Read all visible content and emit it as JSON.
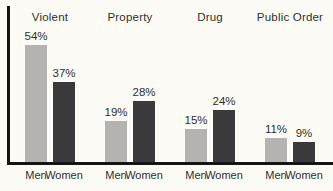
{
  "chart_data": {
    "type": "bar",
    "title": "",
    "categories": [
      "Violent",
      "Property",
      "Drug",
      "Public Order"
    ],
    "series": [
      {
        "name": "Men",
        "values": [
          54,
          19,
          15,
          11
        ],
        "labels": [
          "54%",
          "19%",
          "15%",
          "11%"
        ],
        "color_key": "men_bar"
      },
      {
        "name": "Women",
        "values": [
          37,
          28,
          24,
          9
        ],
        "labels": [
          "37%",
          "28%",
          "24%",
          "9%"
        ],
        "color_key": "women_bar"
      }
    ],
    "unit": "%",
    "ylim": [
      0,
      60
    ],
    "grid": "off",
    "legend": "none (series labeled under each bar)",
    "axes": "thick black left y-axis line and bottom baseline, no ticks"
  },
  "colors": {
    "men_bar": "#b5b3b0",
    "women_bar": "#3a3a3a",
    "axis": "#151515",
    "text": "#2f2f2f",
    "background": "#fcfbf5"
  }
}
